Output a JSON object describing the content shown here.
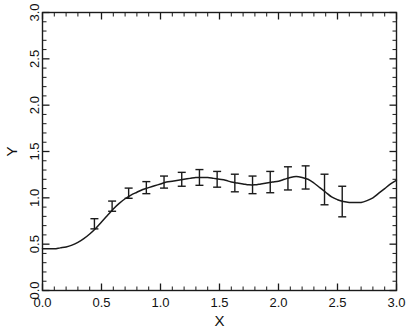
{
  "figure": {
    "width": 411,
    "height": 331,
    "background_color": "#ffffff",
    "foreground_color": "#1a1a1a"
  },
  "chart_data": {
    "type": "line",
    "title": "",
    "subtitle": "",
    "xlabel": "X",
    "ylabel": "Y",
    "xlim": [
      0.0,
      3.0
    ],
    "ylim": [
      0.0,
      3.0
    ],
    "grid": false,
    "legend": null,
    "legend_position": "none",
    "x_ticks": [
      0.0,
      0.5,
      1.0,
      1.5,
      2.0,
      2.5,
      3.0
    ],
    "x_tick_labels": [
      "0.0",
      "0.5",
      "1.0",
      "1.5",
      "2.0",
      "2.5",
      "3.0"
    ],
    "x_minor_tick_step": 0.1,
    "y_ticks": [
      0.0,
      0.5,
      1.0,
      1.5,
      2.0,
      2.5,
      3.0
    ],
    "y_tick_labels": [
      "0.0",
      "0.5",
      "1.0",
      "1.5",
      "2.0",
      "2.5",
      "3.0"
    ],
    "y_minor_tick_step": 0.1,
    "series": [
      {
        "name": "fitted-curve",
        "style": "solid-line",
        "color": "#1a1a1a",
        "x": [
          0.0,
          0.05,
          0.1,
          0.15,
          0.2,
          0.25,
          0.3,
          0.35,
          0.4,
          0.45,
          0.5,
          0.55,
          0.6,
          0.65,
          0.7,
          0.75,
          0.8,
          0.85,
          0.9,
          0.95,
          1.0,
          1.05,
          1.1,
          1.15,
          1.2,
          1.25,
          1.3,
          1.35,
          1.4,
          1.45,
          1.5,
          1.55,
          1.6,
          1.65,
          1.7,
          1.75,
          1.8,
          1.85,
          1.9,
          1.95,
          2.0,
          2.05,
          2.1,
          2.15,
          2.2,
          2.25,
          2.3,
          2.35,
          2.4,
          2.45,
          2.5,
          2.55,
          2.6,
          2.65,
          2.7,
          2.75,
          2.8,
          2.85,
          2.9,
          2.95,
          3.0
        ],
        "y": [
          0.45,
          0.45,
          0.45,
          0.46,
          0.47,
          0.49,
          0.52,
          0.56,
          0.61,
          0.67,
          0.74,
          0.81,
          0.88,
          0.94,
          0.99,
          1.03,
          1.06,
          1.09,
          1.11,
          1.13,
          1.15,
          1.17,
          1.18,
          1.19,
          1.2,
          1.21,
          1.22,
          1.22,
          1.22,
          1.21,
          1.2,
          1.19,
          1.17,
          1.16,
          1.15,
          1.14,
          1.14,
          1.15,
          1.16,
          1.17,
          1.18,
          1.2,
          1.22,
          1.23,
          1.22,
          1.2,
          1.16,
          1.11,
          1.06,
          1.01,
          0.98,
          0.96,
          0.95,
          0.95,
          0.95,
          0.97,
          1.0,
          1.05,
          1.1,
          1.15,
          1.19
        ]
      }
    ],
    "error_bars": {
      "name": "measurement-error-bars",
      "color": "#1a1a1a",
      "cap_style": "tee",
      "points": [
        {
          "x": 0.44,
          "y": 0.72,
          "err": 0.055
        },
        {
          "x": 0.59,
          "y": 0.91,
          "err": 0.055
        },
        {
          "x": 0.73,
          "y": 1.05,
          "err": 0.055
        },
        {
          "x": 0.88,
          "y": 1.11,
          "err": 0.065
        },
        {
          "x": 1.03,
          "y": 1.17,
          "err": 0.065
        },
        {
          "x": 1.18,
          "y": 1.2,
          "err": 0.075
        },
        {
          "x": 1.33,
          "y": 1.22,
          "err": 0.085
        },
        {
          "x": 1.48,
          "y": 1.2,
          "err": 0.085
        },
        {
          "x": 1.63,
          "y": 1.16,
          "err": 0.095
        },
        {
          "x": 1.78,
          "y": 1.14,
          "err": 0.095
        },
        {
          "x": 1.93,
          "y": 1.17,
          "err": 0.115
        },
        {
          "x": 2.08,
          "y": 1.21,
          "err": 0.125
        },
        {
          "x": 2.23,
          "y": 1.22,
          "err": 0.125
        },
        {
          "x": 2.39,
          "y": 1.09,
          "err": 0.165
        },
        {
          "x": 2.54,
          "y": 0.96,
          "err": 0.165
        }
      ]
    }
  }
}
